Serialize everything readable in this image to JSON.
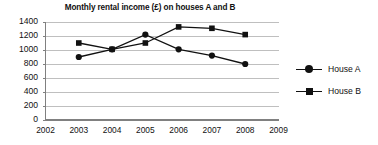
{
  "chart_data": {
    "type": "line",
    "title": "Monthly rental income (£) on houses A and B",
    "xlabel": "",
    "ylabel": "",
    "x": [
      2002,
      2003,
      2004,
      2005,
      2006,
      2007,
      2008,
      2009
    ],
    "xtick_labels": [
      "2002",
      "2003",
      "2004",
      "2005",
      "2006",
      "2007",
      "2008",
      "2009"
    ],
    "ytick_labels": [
      "1400",
      "1200",
      "1000",
      "800",
      "600",
      "400",
      "200",
      "0"
    ],
    "yticks": [
      1400,
      1200,
      1000,
      800,
      600,
      400,
      200,
      0
    ],
    "ylim": [
      0,
      1400
    ],
    "xlim": [
      2002,
      2009
    ],
    "grid": "horizontal",
    "legend_position": "right",
    "series": [
      {
        "name": "House A",
        "marker": "circle",
        "color": "#111111",
        "x": [
          2003,
          2004,
          2005,
          2006,
          2007,
          2008
        ],
        "values": [
          900,
          1010,
          1220,
          1010,
          920,
          800
        ]
      },
      {
        "name": "House B",
        "marker": "square",
        "color": "#111111",
        "x": [
          2003,
          2004,
          2005,
          2006,
          2007,
          2008
        ],
        "values": [
          1100,
          1010,
          1100,
          1330,
          1310,
          1220
        ]
      }
    ]
  },
  "legend": {
    "items": [
      {
        "label": "House A",
        "marker": "circle"
      },
      {
        "label": "House B",
        "marker": "square"
      }
    ]
  },
  "colors": {
    "series": "#111111",
    "gridline": "#bfbfbf",
    "axis": "#808080",
    "background": "#ffffff",
    "text": "#111111"
  }
}
